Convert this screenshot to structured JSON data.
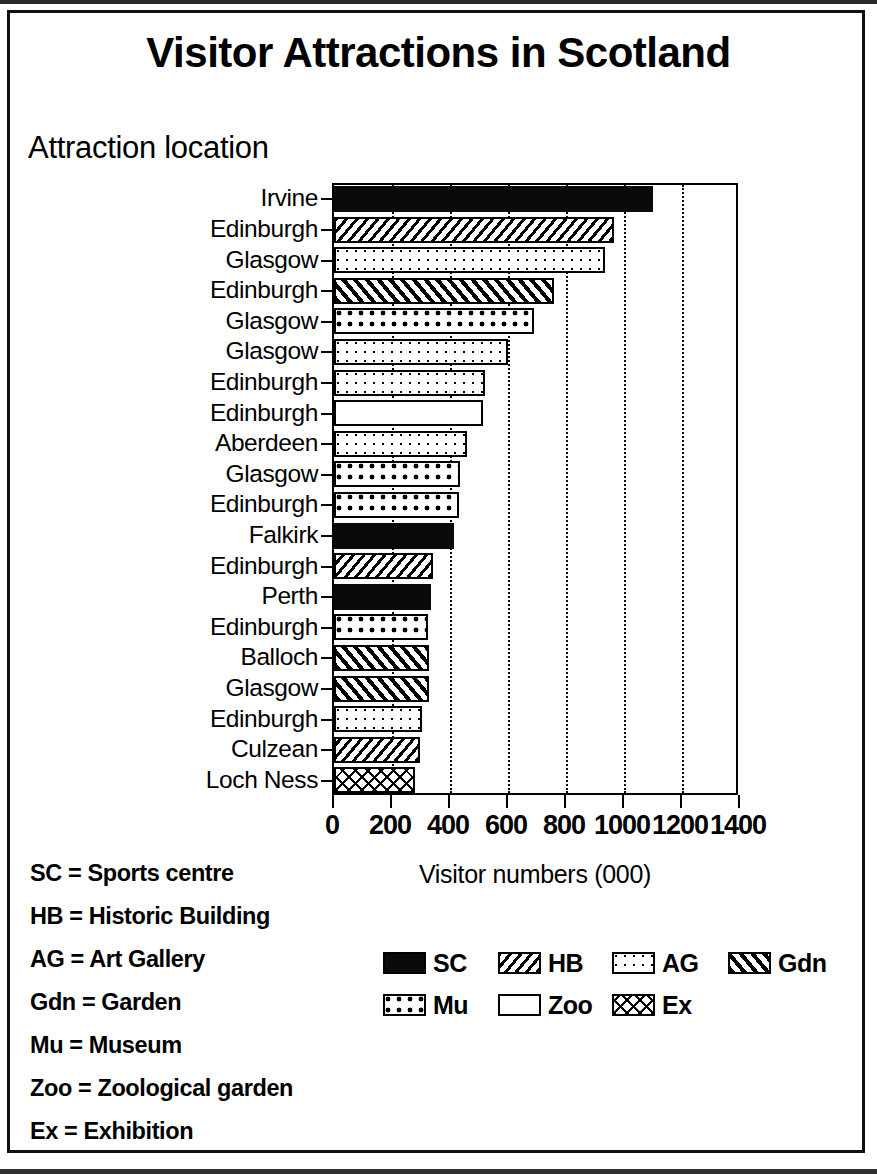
{
  "title": "Visitor Attractions in Scotland",
  "y_axis_title": "Attraction location",
  "x_axis_title": "Visitor numbers (000)",
  "key": {
    "items": [
      {
        "abbr": "SC",
        "text": "SC = Sports centre"
      },
      {
        "abbr": "HB",
        "text": "HB = Historic Building"
      },
      {
        "abbr": "AG",
        "text": "AG = Art Gallery"
      },
      {
        "abbr": "Gdn",
        "text": "Gdn = Garden"
      },
      {
        "abbr": "Mu",
        "text": "Mu = Museum"
      },
      {
        "abbr": "Zoo",
        "text": "Zoo = Zoological garden"
      },
      {
        "abbr": "Ex",
        "text": "Ex = Exhibition"
      }
    ]
  },
  "legend": {
    "rows": [
      [
        {
          "label": "SC",
          "pattern": "sc"
        },
        {
          "label": "HB",
          "pattern": "hb"
        },
        {
          "label": "AG",
          "pattern": "ag"
        },
        {
          "label": "Gdn",
          "pattern": "gdn"
        }
      ],
      [
        {
          "label": "Mu",
          "pattern": "mu"
        },
        {
          "label": "Zoo",
          "pattern": "zoo"
        },
        {
          "label": "Ex",
          "pattern": "ex"
        }
      ]
    ]
  },
  "chart_data": {
    "type": "bar",
    "orientation": "horizontal",
    "title": "Visitor Attractions in Scotland",
    "xlabel": "Visitor numbers (000)",
    "ylabel": "Attraction location",
    "xlim": [
      0,
      1400
    ],
    "xticks": [
      0,
      200,
      400,
      600,
      800,
      1000,
      1200,
      1400
    ],
    "grid": "vertical-dotted",
    "legend_position": "below-plot",
    "categories": [
      "Irvine",
      "Edinburgh",
      "Glasgow",
      "Edinburgh",
      "Glasgow",
      "Glasgow",
      "Edinburgh",
      "Edinburgh",
      "Aberdeen",
      "Glasgow",
      "Edinburgh",
      "Falkirk",
      "Edinburgh",
      "Perth",
      "Edinburgh",
      "Balloch",
      "Glasgow",
      "Edinburgh",
      "Culzean",
      "Loch Ness"
    ],
    "values": [
      1100,
      965,
      935,
      760,
      690,
      600,
      520,
      515,
      460,
      435,
      430,
      415,
      340,
      335,
      325,
      328,
      328,
      303,
      297,
      280
    ],
    "patterns": [
      "sc",
      "hb",
      "ag",
      "gdn",
      "mu",
      "ag",
      "ag",
      "zoo",
      "ag",
      "mu",
      "mu",
      "sc",
      "hb",
      "sc",
      "mu",
      "gdn",
      "gdn",
      "ag",
      "hb",
      "ex"
    ],
    "pattern_legend": {
      "sc": "SC",
      "hb": "HB",
      "ag": "AG",
      "gdn": "Gdn",
      "mu": "Mu",
      "zoo": "Zoo",
      "ex": "Ex"
    }
  }
}
